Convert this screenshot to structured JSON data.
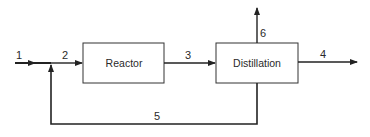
{
  "diagram": {
    "type": "process-flow",
    "units": [
      {
        "id": "reactor",
        "label": "Reactor"
      },
      {
        "id": "distillation",
        "label": "Distillation"
      }
    ],
    "streams": [
      {
        "id": "1",
        "label": "1",
        "from": "feed",
        "to": "mixer"
      },
      {
        "id": "2",
        "label": "2",
        "from": "mixer",
        "to": "reactor"
      },
      {
        "id": "3",
        "label": "3",
        "from": "reactor",
        "to": "distillation"
      },
      {
        "id": "4",
        "label": "4",
        "from": "distillation",
        "to": "product"
      },
      {
        "id": "5",
        "label": "5",
        "from": "distillation",
        "to": "mixer",
        "kind": "recycle"
      },
      {
        "id": "6",
        "label": "6",
        "from": "distillation",
        "to": "overhead"
      }
    ],
    "colors": {
      "line": "#222222",
      "box_border": "#333333",
      "background": "#ffffff"
    }
  }
}
